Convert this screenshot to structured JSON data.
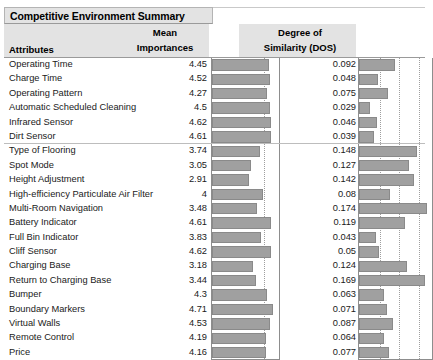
{
  "panel": {
    "title": "Competitive Environment Summary"
  },
  "table": {
    "headers": {
      "attributes": "Attributes",
      "mean_line1": "Mean",
      "mean_line2": "Importances",
      "dos_line1": "Degree of",
      "dos_line2": "Similarity (DOS)"
    }
  },
  "chart_data": {
    "type": "bar",
    "title": "Competitive Environment Summary",
    "xlabel": "",
    "ylabel": "Attributes",
    "grid": true,
    "legend": "none",
    "categories": [
      "Operating Time",
      "Charge Time",
      "Operating Pattern",
      "Automatic Scheduled Cleaning",
      "Infrared Sensor",
      "Dirt Sensor",
      "Type of Flooring",
      "Spot Mode",
      "Height Adjustment",
      "High-efficiency Particulate Air Filter",
      "Multi-Room Navigation",
      "Battery Indicator",
      "Full Bin Indicator",
      "Cliff Sensor",
      "Charging Base",
      "Return to Charging Base",
      "Bumper",
      "Boundary Markers",
      "Virtual Walls",
      "Remote Control",
      "Price"
    ],
    "group_breaks": [
      5
    ],
    "series": [
      {
        "name": "Mean Importances",
        "values": [
          4.45,
          4.52,
          4.27,
          4.5,
          4.62,
          4.61,
          3.74,
          3.05,
          2.91,
          4,
          3.48,
          4.61,
          3.83,
          4.62,
          3.18,
          3.44,
          4.3,
          4.71,
          4.53,
          4.19,
          4.16
        ],
        "labels": [
          "4.45",
          "4.52",
          "4.27",
          "4.5",
          "4.62",
          "4.61",
          "3.74",
          "3.05",
          "2.91",
          "4",
          "3.48",
          "4.61",
          "3.83",
          "4.62",
          "3.18",
          "3.44",
          "4.3",
          "4.71",
          "4.53",
          "4.19",
          "4.16"
        ],
        "xlim": [
          0,
          5.05
        ],
        "gridticks": [
          4.0
        ]
      },
      {
        "name": "Degree of Similarity (DOS)",
        "values": [
          0.092,
          0.048,
          0.075,
          0.029,
          0.046,
          0.039,
          0.148,
          0.127,
          0.142,
          0.08,
          0.174,
          0.119,
          0.043,
          0.05,
          0.124,
          0.169,
          0.063,
          0.071,
          0.087,
          0.064,
          0.077
        ],
        "labels": [
          "0.092",
          "0.048",
          "0.075",
          "0.029",
          "0.046",
          "0.039",
          "0.148",
          "0.127",
          "0.142",
          "0.08",
          "0.174",
          "0.119",
          "0.043",
          "0.05",
          "0.124",
          "0.169",
          "0.063",
          "0.071",
          "0.087",
          "0.064",
          "0.077"
        ],
        "xlim": [
          0,
          0.182
        ],
        "gridticks": [
          0.05,
          0.1,
          0.15
        ]
      }
    ],
    "colors": {
      "bar_fill": "#a0a0a0",
      "bar_border": "#8a8a8a",
      "header_bg": "#e3e3e3",
      "grid": "#9e9e9e",
      "frame": "#8d8d8d"
    }
  }
}
